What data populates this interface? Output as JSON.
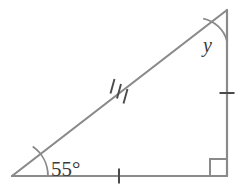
{
  "figure": {
    "type": "right-triangle-diagram",
    "background_color": "#ffffff",
    "stroke_color": "#808080",
    "label_color": "#3a3a3a",
    "stroke_width": 2,
    "canvas": {
      "width": 246,
      "height": 195
    },
    "vertices": {
      "left": {
        "name": "left-vertex",
        "x": 12,
        "y": 176
      },
      "bottom_right": {
        "name": "bottom-right-vertex",
        "x": 227,
        "y": 176
      },
      "top_right": {
        "name": "top-right-vertex",
        "x": 227,
        "y": 10
      }
    },
    "sides": [
      {
        "name": "base-side",
        "from": "left",
        "to": "bottom_right",
        "tick_marks": 1
      },
      {
        "name": "vertical-side",
        "from": "bottom_right",
        "to": "top_right",
        "tick_marks": 1
      },
      {
        "name": "hypotenuse-side",
        "from": "left",
        "to": "top_right",
        "tick_marks": 3
      }
    ],
    "angles": [
      {
        "name": "angle-55",
        "at": "left",
        "label": "55°",
        "value": 55,
        "unit": "degrees",
        "marker": "arc"
      },
      {
        "name": "angle-y",
        "at": "top_right",
        "label": "y",
        "value": null,
        "unit": "degrees",
        "marker": "arc"
      },
      {
        "name": "angle-right",
        "at": "bottom_right",
        "label": "",
        "value": 90,
        "unit": "degrees",
        "marker": "square"
      }
    ],
    "labels": {
      "angle_55": "55°",
      "angle_y": "y"
    }
  }
}
